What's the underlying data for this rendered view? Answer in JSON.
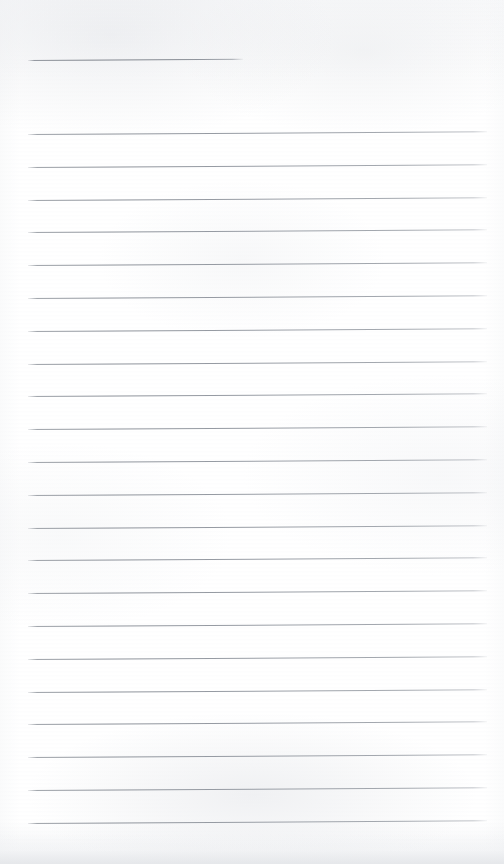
{
  "document": {
    "kind": "lined-notepad-page",
    "title": "Blank ruled notepad page",
    "paper_color": "#ffffff",
    "rule_color": "#8e939b",
    "content_text": "",
    "text_lines": [],
    "page_width": 504,
    "page_height": 864
  },
  "layout": {
    "rule_left_x": 28,
    "rule_right_x": 487,
    "first_rule_y": 60,
    "first_rule_is_short": true,
    "short_rule_right_x": 243,
    "body_first_rule_y": 134,
    "rule_spacing": 32.8,
    "body_rule_count": 22,
    "tilt_degrees": -0.33
  },
  "rules": [
    {
      "id": "rule-0",
      "y": 60,
      "x1": 28,
      "x2": 243,
      "short": true
    },
    {
      "id": "rule-1",
      "y": 134,
      "x1": 28,
      "x2": 487,
      "short": false
    },
    {
      "id": "rule-2",
      "y": 166.8,
      "x1": 28,
      "x2": 487,
      "short": false
    },
    {
      "id": "rule-3",
      "y": 199.6,
      "x1": 28,
      "x2": 487,
      "short": false
    },
    {
      "id": "rule-4",
      "y": 232.4,
      "x1": 28,
      "x2": 487,
      "short": false
    },
    {
      "id": "rule-5",
      "y": 265.2,
      "x1": 28,
      "x2": 487,
      "short": false
    },
    {
      "id": "rule-6",
      "y": 298.0,
      "x1": 28,
      "x2": 487,
      "short": false
    },
    {
      "id": "rule-7",
      "y": 330.8,
      "x1": 28,
      "x2": 487,
      "short": false
    },
    {
      "id": "rule-8",
      "y": 363.6,
      "x1": 28,
      "x2": 487,
      "short": false
    },
    {
      "id": "rule-9",
      "y": 396.4,
      "x1": 28,
      "x2": 487,
      "short": false
    },
    {
      "id": "rule-10",
      "y": 429.2,
      "x1": 28,
      "x2": 487,
      "short": false
    },
    {
      "id": "rule-11",
      "y": 462.0,
      "x1": 28,
      "x2": 487,
      "short": false
    },
    {
      "id": "rule-12",
      "y": 494.8,
      "x1": 28,
      "x2": 487,
      "short": false
    },
    {
      "id": "rule-13",
      "y": 527.6,
      "x1": 28,
      "x2": 487,
      "short": false
    },
    {
      "id": "rule-14",
      "y": 560.4,
      "x1": 28,
      "x2": 487,
      "short": false
    },
    {
      "id": "rule-15",
      "y": 593.2,
      "x1": 28,
      "x2": 487,
      "short": false
    },
    {
      "id": "rule-16",
      "y": 626.0,
      "x1": 28,
      "x2": 487,
      "short": false
    },
    {
      "id": "rule-17",
      "y": 658.8,
      "x1": 28,
      "x2": 487,
      "short": false
    },
    {
      "id": "rule-18",
      "y": 691.6,
      "x1": 28,
      "x2": 487,
      "short": false
    },
    {
      "id": "rule-19",
      "y": 724.4,
      "x1": 28,
      "x2": 487,
      "short": false
    },
    {
      "id": "rule-20",
      "y": 757.2,
      "x1": 28,
      "x2": 487,
      "short": false
    },
    {
      "id": "rule-21",
      "y": 790.0,
      "x1": 28,
      "x2": 487,
      "short": false
    },
    {
      "id": "rule-22",
      "y": 822.8,
      "x1": 28,
      "x2": 487,
      "short": false
    }
  ]
}
